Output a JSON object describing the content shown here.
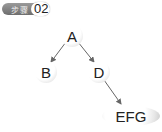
{
  "badge": {
    "label": "步骤",
    "number": "02"
  },
  "tree": {
    "nodes": [
      {
        "id": "A",
        "label": "A"
      },
      {
        "id": "B",
        "label": "B"
      },
      {
        "id": "D",
        "label": "D"
      },
      {
        "id": "EFG",
        "label": "EFG"
      }
    ],
    "edges": [
      {
        "from": "A",
        "to": "B"
      },
      {
        "from": "A",
        "to": "D"
      },
      {
        "from": "D",
        "to": "EFG"
      }
    ]
  },
  "colors": {
    "edge": "#666666",
    "node_fill": "#ffffff",
    "node_shade": "#c9c9c9",
    "badge_bg": "#808080"
  }
}
